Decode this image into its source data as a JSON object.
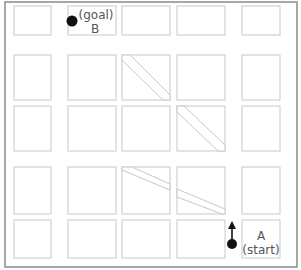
{
  "diagram": {
    "type": "street-grid-map",
    "grid": {
      "rows": 5,
      "columns": 5
    },
    "colors": {
      "frame": "#8a8a8a",
      "block_outline": "#c8c8c8",
      "background": "#ffffff",
      "marker": "#111111",
      "label_text": "#555555"
    },
    "diagonal_streets": [
      {
        "name": "diagonal-street-upper",
        "description": "runs from top-left of row 2 col 3 down-right through row 3 col 4"
      },
      {
        "name": "diagonal-street-lower",
        "description": "runs from top-left of row 4 col 3 down-right through row 4 col 4"
      }
    ],
    "points": {
      "goal": {
        "letter": "B",
        "caption": "(goal)",
        "block": {
          "row": 1,
          "column": 2
        }
      },
      "start": {
        "letter": "A",
        "caption": "(start)",
        "block": {
          "row": 5,
          "column": 5
        }
      }
    },
    "start_arrow": {
      "direction": "up"
    }
  }
}
